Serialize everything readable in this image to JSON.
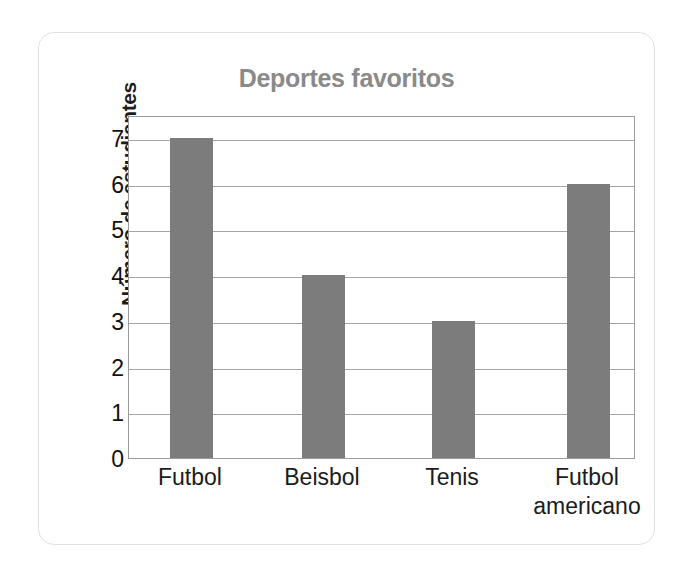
{
  "chart_data": {
    "type": "bar",
    "title": "Deportes favoritos",
    "xlabel": "",
    "ylabel": "Número de estudiantes",
    "categories": [
      "Futbol",
      "Beisbol",
      "Tenis",
      "Futbol americano"
    ],
    "category_lines": [
      [
        "Futbol"
      ],
      [
        "Beisbol"
      ],
      [
        "Tenis"
      ],
      [
        "Futbol",
        "americano"
      ]
    ],
    "values": [
      7,
      4,
      3,
      6
    ],
    "ylim": [
      0,
      7.5
    ],
    "yticks": [
      0,
      1,
      2,
      3,
      4,
      5,
      6,
      7
    ],
    "ytick_labels": [
      "0",
      "1",
      "2",
      "3",
      "4",
      "5",
      "6",
      "7"
    ],
    "grid": true,
    "legend": false,
    "bar_color": "#7c7c7c",
    "title_color": "#8a8a8a",
    "axis_color": "#9a9a9a",
    "gridline_color": "#a5a5a5",
    "card_border_color": "#e2e2e2",
    "background_color": "#ffffff"
  }
}
